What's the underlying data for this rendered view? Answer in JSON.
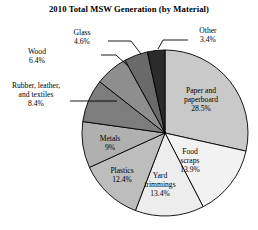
{
  "chart_data": {
    "type": "pie",
    "title": "2010 Total MSW Generation (by Material)",
    "xlabel": "",
    "ylabel": "",
    "legend_position": "none",
    "grid": false,
    "start_angle_deg": 0,
    "direction": "clockwise",
    "categories": [
      "Paper and paperboard",
      "Food scraps",
      "Yard trimmings",
      "Plastics",
      "Metals",
      "Rubber, leather, and textiles",
      "Wood",
      "Glass",
      "Other"
    ],
    "values": [
      28.5,
      13.9,
      13.4,
      12.4,
      9.0,
      8.4,
      6.4,
      4.6,
      3.4
    ],
    "value_labels": [
      "28.5%",
      "13.9%",
      "13.4%",
      "12.4%",
      "9%",
      "8.4%",
      "6.4%",
      "4.6%",
      "3.4%"
    ],
    "slice_colors": [
      "#c9c9c9",
      "#f2f2f2",
      "#ededed",
      "#bdbdbd",
      "#b0b0b0",
      "#7d7d7d",
      "#8e8e8e",
      "#6a6a6a",
      "#2b2b2b"
    ],
    "slices": [
      {
        "label": "Paper and paperboard",
        "label_line1": "Paper and",
        "label_line2": "paperboard",
        "value": 28.5,
        "value_label": "28.5%",
        "color": "#c9c9c9",
        "callout": false
      },
      {
        "label": "Food scraps",
        "label_line1": "Food",
        "label_line2": "scraps",
        "value": 13.9,
        "value_label": "13.9%",
        "color": "#f2f2f2",
        "callout": false
      },
      {
        "label": "Yard trimmings",
        "label_line1": "Yard",
        "label_line2": "trimmings",
        "value": 13.4,
        "value_label": "13.4%",
        "color": "#ededed",
        "callout": false
      },
      {
        "label": "Plastics",
        "label_line1": "Plastics",
        "label_line2": "",
        "value": 12.4,
        "value_label": "12.4%",
        "color": "#bdbdbd",
        "callout": false
      },
      {
        "label": "Metals",
        "label_line1": "Metals",
        "label_line2": "",
        "value": 9.0,
        "value_label": "9%",
        "color": "#b0b0b0",
        "callout": false
      },
      {
        "label": "Rubber, leather, and textiles",
        "label_line1": "Rubber, leather,",
        "label_line2": "and textiles",
        "value": 8.4,
        "value_label": "8.4%",
        "color": "#7d7d7d",
        "callout": true
      },
      {
        "label": "Wood",
        "label_line1": "Wood",
        "label_line2": "",
        "value": 6.4,
        "value_label": "6.4%",
        "color": "#8e8e8e",
        "callout": true
      },
      {
        "label": "Glass",
        "label_line1": "Glass",
        "label_line2": "",
        "value": 4.6,
        "value_label": "4.6%",
        "color": "#6a6a6a",
        "callout": true
      },
      {
        "label": "Other",
        "label_line1": "Other",
        "label_line2": "",
        "value": 3.4,
        "value_label": "3.4%",
        "color": "#2b2b2b",
        "callout": true
      }
    ]
  },
  "colors": {
    "background": "#ffffff",
    "outline": "#000000",
    "text": "#000000"
  }
}
